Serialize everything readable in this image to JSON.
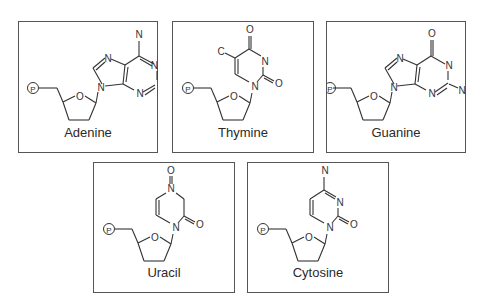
{
  "figure": {
    "panels": [
      {
        "id": "adenine",
        "name": "Adenine",
        "atoms": {
          "n_amino": "N",
          "n1": "N",
          "n3": "N",
          "n7": "N",
          "n9": "N",
          "o_sugar": "O",
          "phosphate": "P"
        }
      },
      {
        "id": "thymine",
        "name": "Thymine",
        "atoms": {
          "c_methyl": "C",
          "o4": "O",
          "n3": "N",
          "o2": "O",
          "n1": "N",
          "o_sugar": "O",
          "phosphate": "P"
        }
      },
      {
        "id": "guanine",
        "name": "Guanine",
        "atoms": {
          "o6": "O",
          "n1": "N",
          "n_amino": "N",
          "n3": "N",
          "n7": "N",
          "n9": "N",
          "o_sugar": "O",
          "phosphate": "P"
        }
      },
      {
        "id": "uracil",
        "name": "Uracil",
        "atoms": {
          "o_top": "O",
          "n_top": "N",
          "n1": "N",
          "o2": "O",
          "o_sugar": "O",
          "phosphate": "P"
        }
      },
      {
        "id": "cytosine",
        "name": "Cytosine",
        "atoms": {
          "n_amino": "N",
          "n3": "N",
          "n1": "N",
          "o2": "O",
          "o_sugar": "O",
          "phosphate": "P"
        }
      }
    ]
  }
}
